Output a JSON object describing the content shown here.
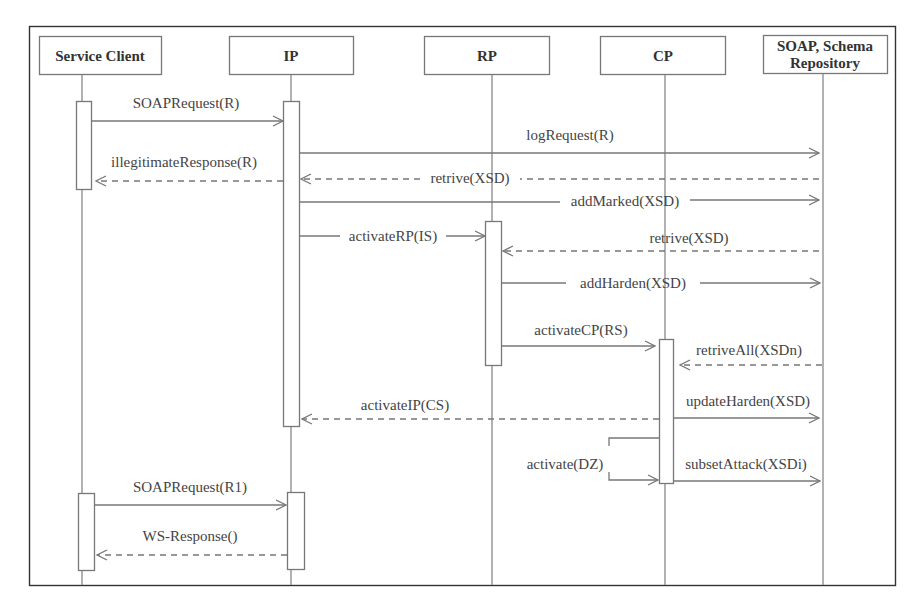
{
  "diagram": {
    "type": "sequence-diagram",
    "colors": {
      "line": "#777777",
      "frame": "#333333",
      "text": "#444444",
      "background": "#ffffff"
    },
    "participants": [
      {
        "id": "client",
        "label_lines": [
          "Service Client"
        ],
        "x": 82
      },
      {
        "id": "ip",
        "label_lines": [
          "IP"
        ],
        "x": 291
      },
      {
        "id": "rp",
        "label_lines": [
          "RP"
        ],
        "x": 492
      },
      {
        "id": "cp",
        "label_lines": [
          "CP"
        ],
        "x": 665
      },
      {
        "id": "repo",
        "label_lines": [
          "SOAP, Schema",
          "Repository"
        ],
        "x": 822
      }
    ],
    "messages": [
      {
        "label": "SOAPRequest(R)",
        "from": "client",
        "to": "ip",
        "style": "solid"
      },
      {
        "label": "logRequest(R)",
        "from": "ip",
        "to": "repo",
        "style": "solid"
      },
      {
        "label": "illegitimateResponse(R)",
        "from": "ip",
        "to": "client",
        "style": "dashed"
      },
      {
        "label": "retrive(XSD)",
        "from": "repo",
        "to": "ip",
        "style": "dashed"
      },
      {
        "label": "addMarked(XSD)",
        "from": "ip",
        "to": "repo",
        "style": "solid"
      },
      {
        "label": "activateRP(IS)",
        "from": "ip",
        "to": "rp",
        "style": "solid"
      },
      {
        "label": "retrive(XSD)",
        "from": "repo",
        "to": "rp",
        "style": "dashed"
      },
      {
        "label": "addHarden(XSD)",
        "from": "rp",
        "to": "repo",
        "style": "solid"
      },
      {
        "label": "activateCP(RS)",
        "from": "rp",
        "to": "cp",
        "style": "solid"
      },
      {
        "label": "retriveAll(XSDn)",
        "from": "repo",
        "to": "cp",
        "style": "dashed"
      },
      {
        "label": "updateHarden(XSD)",
        "from": "cp",
        "to": "repo",
        "style": "solid"
      },
      {
        "label": "activateIP(CS)",
        "from": "cp",
        "to": "ip",
        "style": "dashed"
      },
      {
        "label": "activate(DZ)",
        "from": "cp",
        "to": "cp",
        "style": "self"
      },
      {
        "label": "subsetAttack(XSDi)",
        "from": "cp",
        "to": "repo",
        "style": "solid"
      },
      {
        "label": "SOAPRequest(R1)",
        "from": "client",
        "to": "ip",
        "style": "solid"
      },
      {
        "label": "WS-Response()",
        "from": "ip",
        "to": "client",
        "style": "dashed"
      }
    ]
  }
}
